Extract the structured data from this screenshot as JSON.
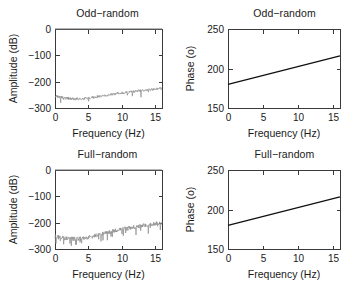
{
  "figure": {
    "width": 359,
    "height": 282,
    "background": "#ffffff",
    "trace_color": "#8d8d8d",
    "phase_color": "#101010",
    "axis_color": "#3a3a3a"
  },
  "chart_data": [
    {
      "id": "odd-random-amplitude",
      "type": "line",
      "title": "Odd−random",
      "xlabel": "Frequency (Hz)",
      "ylabel": "Amplitude (dB)",
      "xlim": [
        0,
        16
      ],
      "ylim": [
        -300,
        0
      ],
      "xticks": [
        0,
        5,
        10,
        15
      ],
      "xticklabels": [
        "0",
        "5",
        "10",
        "15"
      ],
      "yticks": [
        0,
        -100,
        -200,
        -300
      ],
      "yticklabels": [
        "0",
        "−100",
        "−200",
        "−300"
      ],
      "grid": false,
      "legend": "none",
      "series": [
        {
          "name": "excitation line",
          "style": "solid",
          "color": "#6e6e6e",
          "x": [
            0,
            16
          ],
          "values": [
            0,
            0
          ]
        },
        {
          "name": "noise floor",
          "style": "noisy",
          "color": "#8d8d8d",
          "description": "Dense noise floor; mean starts near −255 dB at 0 Hz, dips to about −266 dB near 3–4 Hz, then rises steadily to about −226 dB at 16 Hz. Peak-to-peak scatter roughly 10 dB with occasional downward spikes to −290 dB.",
          "x": [
            0,
            1,
            2,
            3,
            4,
            5,
            6,
            7,
            8,
            9,
            10,
            11,
            12,
            13,
            14,
            15,
            16
          ],
          "values": [
            -255,
            -259,
            -263,
            -266,
            -265,
            -262,
            -258,
            -254,
            -250,
            -246,
            -243,
            -240,
            -237,
            -234,
            -231,
            -228,
            -226
          ],
          "band_half_width": 5.0,
          "noise_seed": 7,
          "noise_density": 3.0,
          "spike_rate": 0.035,
          "spike_depth": 26
        }
      ]
    },
    {
      "id": "odd-random-phase",
      "type": "line",
      "title": "Odd−random",
      "xlabel": "Frequency (Hz)",
      "ylabel": "Phase (o)",
      "xlim": [
        0,
        16
      ],
      "ylim": [
        150,
        250
      ],
      "xticks": [
        0,
        5,
        10,
        15
      ],
      "xticklabels": [
        "0",
        "5",
        "10",
        "15"
      ],
      "yticks": [
        250,
        200,
        150
      ],
      "yticklabels": [
        "250",
        "200",
        "150"
      ],
      "grid": false,
      "legend": "none",
      "series": [
        {
          "name": "phase",
          "style": "solid",
          "color": "#101010",
          "x": [
            0,
            16
          ],
          "values": [
            180,
            216
          ]
        }
      ]
    },
    {
      "id": "full-random-amplitude",
      "type": "line",
      "title": "Full−random",
      "xlabel": "Frequency (Hz)",
      "ylabel": "Amplitude (dB)",
      "xlim": [
        0,
        16
      ],
      "ylim": [
        -300,
        0
      ],
      "xticks": [
        0,
        5,
        10,
        15
      ],
      "xticklabels": [
        "0",
        "5",
        "10",
        "15"
      ],
      "yticks": [
        0,
        -100,
        -200,
        -300
      ],
      "yticklabels": [
        "0",
        "−100",
        "−200",
        "−300"
      ],
      "grid": false,
      "legend": "none",
      "series": [
        {
          "name": "excitation line",
          "style": "solid",
          "color": "#6e6e6e",
          "x": [
            0,
            16
          ],
          "values": [
            0,
            0
          ]
        },
        {
          "name": "noise floor",
          "style": "noisy",
          "color": "#8d8d8d",
          "description": "Broader, rougher noise floor than the odd−random case; mean near −252 dB at 0 Hz, shallow minimum about −262 dB near 3 Hz, rising to roughly −200 dB at 16 Hz, with large scatter and frequent spikes.",
          "x": [
            0,
            1,
            2,
            3,
            4,
            5,
            6,
            7,
            8,
            9,
            10,
            11,
            12,
            13,
            14,
            15,
            16
          ],
          "values": [
            -252,
            -257,
            -261,
            -262,
            -260,
            -256,
            -249,
            -242,
            -236,
            -230,
            -225,
            -221,
            -216,
            -212,
            -208,
            -204,
            -201
          ],
          "band_half_width": 8.0,
          "noise_seed": 23,
          "noise_density": 3.0,
          "spike_rate": 0.09,
          "spike_depth": 32
        }
      ]
    },
    {
      "id": "full-random-phase",
      "type": "line",
      "title": "Full−random",
      "xlabel": "Frequency (Hz)",
      "ylabel": "Phase (o)",
      "xlim": [
        0,
        16
      ],
      "ylim": [
        150,
        250
      ],
      "xticks": [
        0,
        5,
        10,
        15
      ],
      "xticklabels": [
        "0",
        "5",
        "10",
        "15"
      ],
      "yticks": [
        250,
        200,
        150
      ],
      "yticklabels": [
        "250",
        "200",
        "150"
      ],
      "grid": false,
      "legend": "none",
      "series": [
        {
          "name": "phase",
          "style": "solid",
          "color": "#101010",
          "x": [
            0,
            16
          ],
          "values": [
            180,
            216
          ]
        }
      ]
    }
  ]
}
